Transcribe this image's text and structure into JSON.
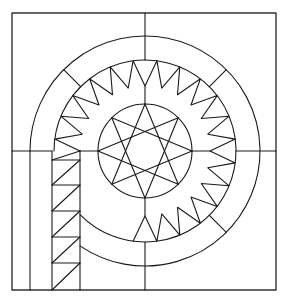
{
  "diagram": {
    "colors": {
      "background": "#ffffff",
      "line": "#1a1a1a",
      "frame": "#333333"
    },
    "stroke_width": 1.1,
    "frame": {
      "x1": 12,
      "y1": 13,
      "x2": 276,
      "y2": 290
    },
    "center": {
      "x": 145,
      "y": 151
    },
    "cross_lines": {
      "vertical_x": 145,
      "horizontal_y": 151
    },
    "rings": {
      "outer_r": 115,
      "sawtooth_outer_r": 91,
      "sawtooth_inner_r": 65,
      "star_circle_r": 47
    },
    "outer_ring_radials_deg": [
      45,
      135,
      -45
    ],
    "sawtooth": {
      "teeth": 24,
      "start_deg": 180,
      "phase_deg": 0
    },
    "star": {
      "points": 8,
      "skip": 3,
      "rotation_deg": -90
    },
    "strip": {
      "x_outer": 30,
      "x_left": 52,
      "x_right": 80,
      "y_top": 151,
      "y_bottom": 290,
      "rungs_y": [
        160,
        185,
        211,
        237,
        263
      ]
    }
  }
}
